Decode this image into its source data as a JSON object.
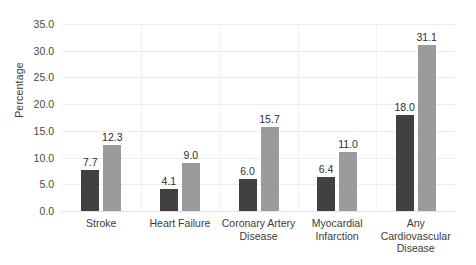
{
  "chart_data": {
    "type": "bar",
    "title": "",
    "xlabel": "",
    "ylabel": "Percentage",
    "ylim": [
      0.0,
      35.0
    ],
    "ytick_step": 5.0,
    "yticks": [
      "0.0",
      "5.0",
      "10.0",
      "15.0",
      "20.0",
      "25.0",
      "30.0",
      "35.0"
    ],
    "grid": true,
    "legend": "none",
    "categories": [
      "Stroke",
      "Heart Failure",
      "Coronary Artery Disease",
      "Myocardial Infarction",
      "Any Cardiovascular Disease"
    ],
    "category_lines": [
      [
        "Stroke"
      ],
      [
        "Heart Failure"
      ],
      [
        "Coronary Artery",
        "Disease"
      ],
      [
        "Myocardial",
        "Infarction"
      ],
      [
        "Any",
        "Cardiovascular",
        "Disease"
      ]
    ],
    "series": [
      {
        "name": "series-1",
        "color": "#414141",
        "values": [
          7.7,
          4.1,
          6.0,
          6.4,
          18.0
        ],
        "labels": [
          "7.7",
          "4.1",
          "6.0",
          "6.4",
          "18.0"
        ]
      },
      {
        "name": "series-2",
        "color": "#9b9b9b",
        "values": [
          12.3,
          9.0,
          15.7,
          11.0,
          31.1
        ],
        "labels": [
          "12.3",
          "9.0",
          "15.7",
          "11.0",
          "31.1"
        ]
      }
    ]
  },
  "colors": {
    "background": "#ffffff",
    "gridline": "#ececec",
    "baseline": "#e2e2e2",
    "separator": "#f1f1f1",
    "text": "#3b3b3b",
    "series_dark": "#414141",
    "series_light": "#9b9b9b"
  }
}
